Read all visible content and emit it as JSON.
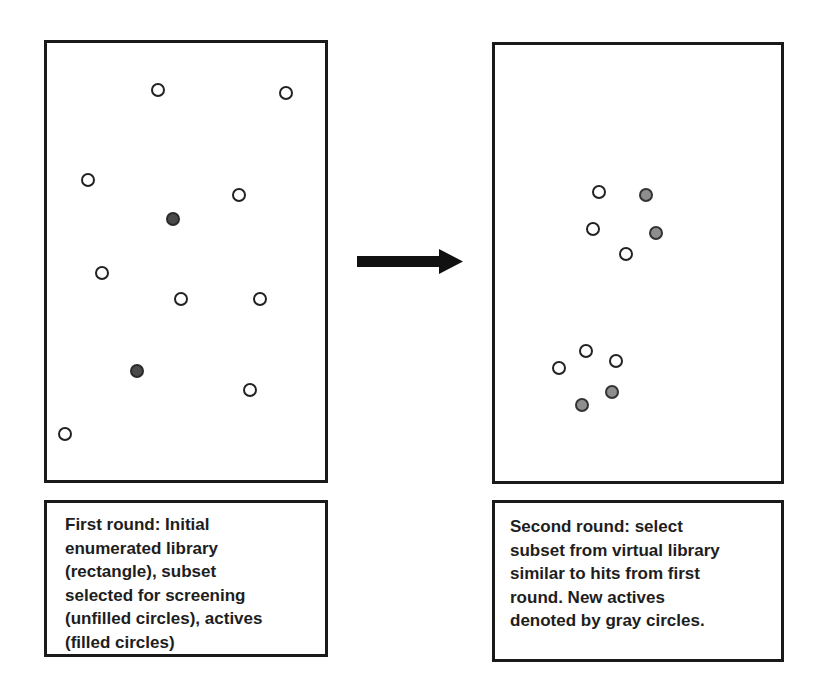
{
  "figure": {
    "colors": {
      "border": "#1a1a1a",
      "unfilled": "#ffffff",
      "filled_active": "#4a4a4a",
      "gray_active": "#8e8e8e",
      "arrow": "#111111"
    },
    "first_round": {
      "panel_label": "Initial enumerated library",
      "circles": [
        {
          "x": 158,
          "y": 90,
          "type": "unfilled"
        },
        {
          "x": 286,
          "y": 93,
          "type": "unfilled"
        },
        {
          "x": 88,
          "y": 180,
          "type": "unfilled"
        },
        {
          "x": 239,
          "y": 195,
          "type": "unfilled"
        },
        {
          "x": 173,
          "y": 219,
          "type": "filled"
        },
        {
          "x": 102,
          "y": 273,
          "type": "unfilled"
        },
        {
          "x": 181,
          "y": 299,
          "type": "unfilled"
        },
        {
          "x": 260,
          "y": 299,
          "type": "unfilled"
        },
        {
          "x": 137,
          "y": 371,
          "type": "filled"
        },
        {
          "x": 250,
          "y": 390,
          "type": "unfilled"
        },
        {
          "x": 65,
          "y": 434,
          "type": "unfilled"
        }
      ],
      "caption_lines": [
        "First round:  Initial",
        "enumerated library",
        "(rectangle), subset",
        "selected for screening",
        "(unfilled circles), actives",
        "(filled circles)"
      ]
    },
    "arrow": {
      "direction": "right",
      "icon": "right-arrow-icon"
    },
    "second_round": {
      "panel_label": "Virtual library",
      "circles": [
        {
          "x": 599,
          "y": 192,
          "type": "unfilled"
        },
        {
          "x": 646,
          "y": 195,
          "type": "gray"
        },
        {
          "x": 593,
          "y": 229,
          "type": "unfilled"
        },
        {
          "x": 656,
          "y": 233,
          "type": "gray"
        },
        {
          "x": 626,
          "y": 254,
          "type": "unfilled"
        },
        {
          "x": 586,
          "y": 351,
          "type": "unfilled"
        },
        {
          "x": 616,
          "y": 361,
          "type": "unfilled"
        },
        {
          "x": 559,
          "y": 368,
          "type": "unfilled"
        },
        {
          "x": 612,
          "y": 392,
          "type": "gray"
        },
        {
          "x": 582,
          "y": 405,
          "type": "gray"
        }
      ],
      "caption_lines": [
        "Second round:  select",
        "subset from virtual library",
        "similar to hits from first",
        "round.  New actives",
        "denoted by gray circles."
      ]
    }
  }
}
